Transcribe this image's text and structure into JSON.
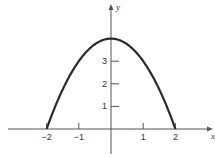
{
  "chart_data": {
    "type": "line",
    "title": "",
    "function": "y = 4 - x^2",
    "xlabel": "x",
    "ylabel": "y",
    "xlim": [
      -2.9,
      3.1
    ],
    "ylim": [
      -1,
      4.5
    ],
    "grid": false,
    "x_ticks": [
      -2,
      -1,
      1,
      2
    ],
    "x_tick_labels": [
      "−2",
      "−1",
      "1",
      "2"
    ],
    "y_ticks": [
      1,
      2,
      3
    ],
    "y_tick_labels": [
      "1",
      "2",
      "3"
    ],
    "series": [
      {
        "name": "parabola",
        "x": [
          -2,
          -1.5,
          -1,
          -0.5,
          0,
          0.5,
          1,
          1.5,
          2
        ],
        "y": [
          0,
          1.75,
          3,
          3.75,
          4,
          3.75,
          3,
          1.75,
          0
        ]
      }
    ],
    "colors": {
      "curve": "#2a2a2a",
      "axes": "#555555"
    }
  }
}
